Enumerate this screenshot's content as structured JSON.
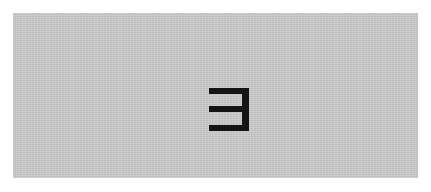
{
  "card": {
    "background_color": "#cbcbcb",
    "glyph": {
      "character": "ヨ",
      "description": "reversed-E shaped glyph (three horizontal bars joined by a right vertical stroke)",
      "color": "#141414"
    }
  }
}
